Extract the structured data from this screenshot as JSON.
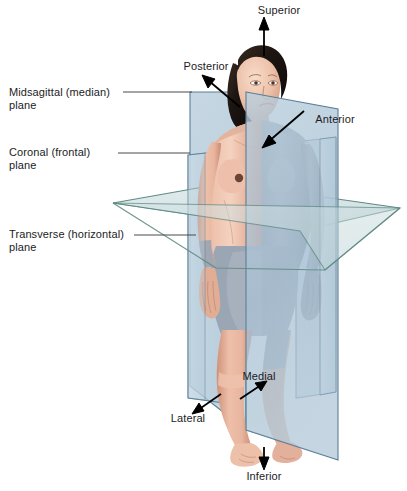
{
  "figure": {
    "width": 407,
    "height": 491,
    "background": "#ffffff"
  },
  "plane_labels": [
    {
      "id": "midsagittal",
      "text": "Midsagittal (median)\nplane"
    },
    {
      "id": "coronal",
      "text": "Coronal (frontal)\nplane"
    },
    {
      "id": "transverse",
      "text": "Transverse (horizontal)\nplane"
    }
  ],
  "direction_labels": [
    {
      "id": "superior",
      "text": "Superior"
    },
    {
      "id": "posterior",
      "text": "Posterior"
    },
    {
      "id": "anterior",
      "text": "Anterior"
    },
    {
      "id": "medial",
      "text": "Medial"
    },
    {
      "id": "lateral",
      "text": "Lateral"
    },
    {
      "id": "inferior",
      "text": "Inferior"
    }
  ],
  "colors": {
    "text": "#1c1c1c",
    "leader_line": "#4a4a4a",
    "arrow": "#000000",
    "sagittal_plane_fill": "#aec4d6",
    "sagittal_plane_edge": "#5b7f96",
    "coronal_plane_fill": "#c3d6e2",
    "coronal_plane_edge": "#5e8296",
    "transverse_plane_fill": "#c9dce0",
    "transverse_plane_edge": "#5f8a83",
    "skin_light": "#f0c9b6",
    "skin_mid": "#e0a892",
    "skin_shadow": "#c88b76",
    "body_shaded": "#9aa5b4",
    "body_shaded_dark": "#7c8794",
    "hair": "#241a17"
  },
  "anatomy": {
    "subject": "standing female figure, anatomical position, front view",
    "hair_color_name": "dark brown",
    "shaded_half": "right side of body behind midsagittal plane"
  }
}
